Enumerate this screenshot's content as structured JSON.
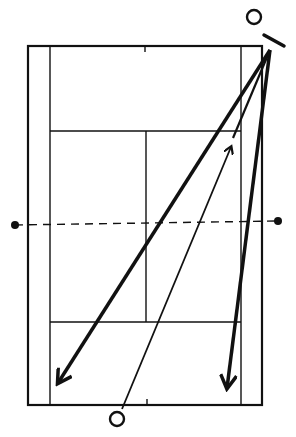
{
  "diagram": {
    "title": "",
    "type": "tennis-court-shot-diagram",
    "colors": {
      "ink": "#111111",
      "background": "#ffffff"
    },
    "court": {
      "outer": {
        "x1": 28,
        "y1": 46,
        "x2": 262,
        "y2": 405
      },
      "singles_left_x": 50,
      "singles_right_x": 241,
      "top_service_line_y": 131,
      "bottom_service_line_y": 322,
      "center_service_x": 146,
      "net": {
        "y_left": 225,
        "y_right": 221,
        "post_left": [
          15,
          225
        ],
        "post_right": [
          278,
          221
        ]
      }
    },
    "players": [
      {
        "id": "top-player",
        "cx": 254,
        "cy": 17,
        "r": 7
      },
      {
        "id": "bottom-player",
        "cx": 117,
        "cy": 419,
        "r": 7
      }
    ],
    "racket": {
      "x1": 264,
      "y1": 35,
      "x2": 284,
      "y2": 46
    },
    "shots": [
      {
        "id": "crosscourt-deep",
        "from": [
          270,
          50
        ],
        "to": [
          58,
          383
        ],
        "weight": "thick",
        "arrow": true
      },
      {
        "id": "down-the-line",
        "from": [
          270,
          50
        ],
        "to": [
          227,
          388
        ],
        "weight": "thick",
        "arrow": true
      },
      {
        "id": "return-shot",
        "from": [
          122,
          409
        ],
        "to": [
          231,
          147
        ],
        "weight": "thin",
        "arrow": true
      },
      {
        "id": "connector",
        "from": [
          270,
          50
        ],
        "to": [
          233,
          138
        ],
        "weight": "thin",
        "arrow": false
      }
    ]
  }
}
